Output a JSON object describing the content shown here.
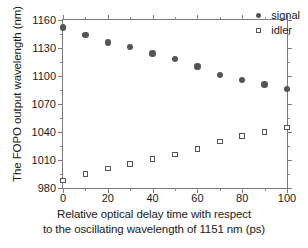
{
  "chart_data": {
    "type": "scatter",
    "title": "",
    "xlabel_lines": [
      "Relative optical delay time with respect",
      "to the oscillating wavelength of 1151 nm (ps)"
    ],
    "ylabel": "The FOPO output wavelength (nm)",
    "xlim": [
      0,
      100
    ],
    "ylim": [
      980,
      1160
    ],
    "xticks": [
      0,
      20,
      40,
      60,
      80,
      100
    ],
    "xtick_labels": [
      "0",
      "20",
      "40",
      "60",
      "80",
      "100"
    ],
    "xticks_minor": [
      10,
      30,
      50,
      70,
      90
    ],
    "yticks": [
      980,
      1010,
      1040,
      1070,
      1100,
      1130,
      1160
    ],
    "ytick_labels": [
      "980",
      "1010",
      "1040",
      "1070",
      "1100",
      "1130",
      "1160"
    ],
    "yticks_minor": [
      995,
      1025,
      1055,
      1085,
      1115,
      1145
    ],
    "grid": false,
    "legend_position": "top-right",
    "x": [
      0,
      10,
      20,
      30,
      40,
      50,
      60,
      70,
      80,
      90,
      100
    ],
    "series": [
      {
        "name": "signal",
        "marker": "filled-circle",
        "color": "#555555",
        "values": [
          1152,
          1144,
          1136,
          1131,
          1124,
          1118,
          1110,
          1101,
          1096,
          1091,
          1086
        ]
      },
      {
        "name": "idler",
        "marker": "open-square",
        "color": "#555555",
        "values": [
          988,
          995,
          1001,
          1006,
          1011,
          1016,
          1022,
          1030,
          1036,
          1040,
          1045
        ]
      }
    ]
  },
  "legend": {
    "entries": [
      {
        "label": "signal"
      },
      {
        "label": "idler"
      }
    ]
  },
  "colors": {
    "axis": "#7a7a7a",
    "marker": "#555555",
    "background": "#ffffff",
    "text": "#1a1a1a"
  }
}
